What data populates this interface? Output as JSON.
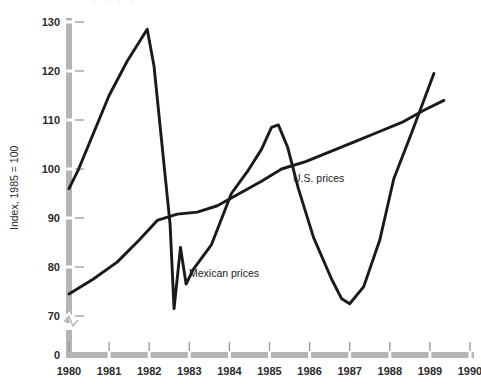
{
  "chart_data": {
    "type": "line",
    "title": "",
    "xlabel": "",
    "ylabel": "Index, 1985 = 100",
    "xlim": [
      1980,
      1990
    ],
    "ylim": [
      70,
      130
    ],
    "yticks": [
      70,
      80,
      90,
      100,
      110,
      120,
      130
    ],
    "ytick_labels": [
      "70",
      "80",
      "90",
      "100",
      "110",
      "120",
      "130"
    ],
    "y_zero_label": "0",
    "y_axis_break": true,
    "xticks": [
      1980,
      1981,
      1982,
      1983,
      1984,
      1985,
      1986,
      1987,
      1988,
      1989,
      1990
    ],
    "xtick_labels": [
      "1980",
      "1981",
      "1982",
      "1983",
      "1984",
      "1985",
      "1986",
      "1987",
      "1988",
      "1989",
      "1990"
    ],
    "grid": false,
    "legend_position": "inline-annotations",
    "series": [
      {
        "name": "Mexican prices",
        "label": "Mexican prices",
        "color": "#1a1a1a",
        "x": [
          1980.0,
          1980.22,
          1981.0,
          1981.45,
          1981.95,
          1982.12,
          1982.52,
          1982.62,
          1982.78,
          1982.92,
          1983.1,
          1983.55,
          1984.05,
          1984.45,
          1984.8,
          1985.05,
          1985.22,
          1985.45,
          1985.72,
          1986.1,
          1986.55,
          1986.8,
          1987.0,
          1987.35,
          1987.75,
          1988.1,
          1988.55,
          1989.1
        ],
        "y": [
          96.0,
          99.6,
          115.0,
          122.0,
          128.5,
          121.0,
          88.8,
          71.5,
          84.0,
          76.5,
          79.5,
          84.5,
          95.0,
          99.5,
          104.0,
          108.5,
          109.0,
          104.5,
          96.0,
          86.0,
          77.5,
          73.5,
          72.5,
          76.0,
          85.5,
          98.0,
          107.5,
          119.5
        ]
      },
      {
        "name": "U.S. prices",
        "label": "U.S. prices",
        "color": "#1a1a1a",
        "x": [
          1980.0,
          1980.6,
          1981.2,
          1981.75,
          1982.2,
          1982.7,
          1983.2,
          1983.7,
          1984.25,
          1984.8,
          1985.3,
          1985.9,
          1986.5,
          1987.1,
          1987.7,
          1988.3,
          1988.85,
          1989.35
        ],
        "y": [
          74.5,
          77.5,
          81.0,
          85.5,
          89.5,
          90.8,
          91.2,
          92.5,
          95.0,
          97.5,
          100.0,
          101.5,
          103.5,
          105.5,
          107.5,
          109.5,
          112.0,
          114.0
        ]
      }
    ],
    "annotations": [
      {
        "text": "Mexican prices",
        "x_px": 189,
        "y_px": 277
      },
      {
        "text": "U.S. prices",
        "x_px": 293,
        "y_px": 182
      }
    ]
  },
  "axis_style": {
    "axis_color": "#b5b5b5",
    "tick_color": "#8f8f8f",
    "text_color": "#2b2b2b",
    "line_color": "#1a1a1a"
  },
  "top_artifact": {
    "text": "· · · ·"
  }
}
